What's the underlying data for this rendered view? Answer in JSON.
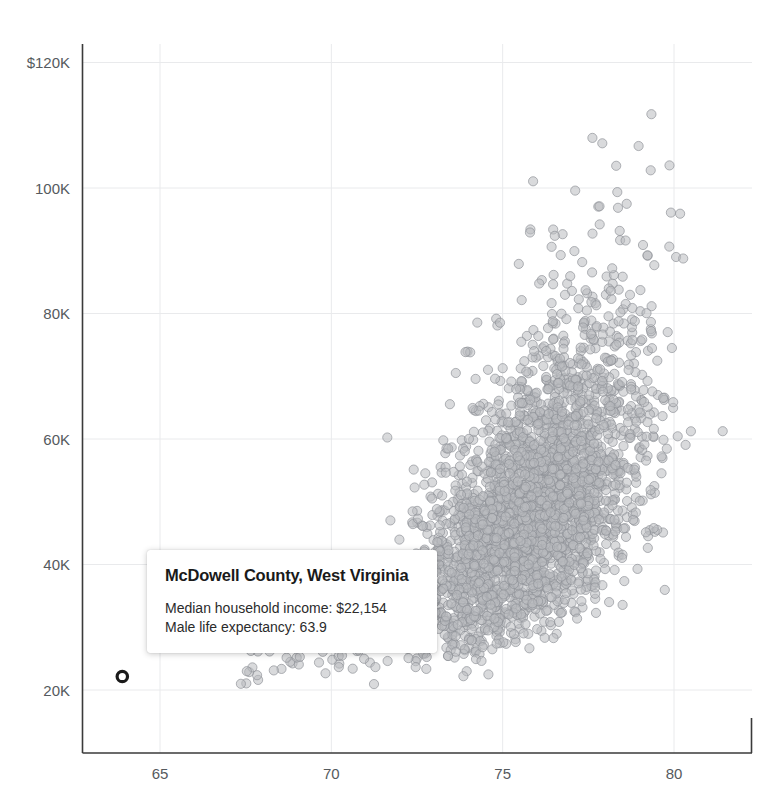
{
  "chart_data": {
    "type": "scatter",
    "title": "",
    "subtitle": "",
    "xlabel": "",
    "ylabel": "",
    "xlim": [
      63.0,
      82.5
    ],
    "ylim": [
      15000,
      125000
    ],
    "grid": true,
    "legend_position": "none",
    "x_ticks": [
      65,
      70,
      75,
      80
    ],
    "x_tick_labels": [
      "65",
      "70",
      "75",
      "80"
    ],
    "y_ticks": [
      20000,
      40000,
      60000,
      80000,
      100000,
      120000
    ],
    "y_tick_labels": [
      "20K",
      "40K",
      "60K",
      "80K",
      "100K",
      "$120K"
    ],
    "point_color": "#b9bcc0",
    "point_edge_color": "#8d9196",
    "point_opacity": 0.55,
    "point_radius": 4.6,
    "n_points": 3140,
    "series": [
      {
        "name": "US counties",
        "x_description": "Male life expectancy (years)",
        "y_description": "Median household income (USD)"
      }
    ],
    "highlighted_point": {
      "label": "McDowell County, West Virginia",
      "x": 63.9,
      "y": 22154,
      "marker": "ring",
      "color": "#1a1a1a"
    },
    "approx_cluster": {
      "center_x": 76.0,
      "center_y": 49000,
      "x_spread": 1.6,
      "y_spread": 12000,
      "correlation": 0.55
    }
  },
  "tooltip": {
    "title": "McDowell County, West Virginia",
    "rows": [
      "Median household income: $22,154",
      "Male life expectancy: 63.9"
    ],
    "row_income": "Median household income: $22,154",
    "row_life": "Male life expectancy: 63.9"
  }
}
